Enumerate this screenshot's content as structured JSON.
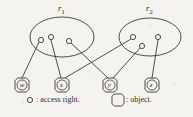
{
  "figure": {
    "type": "access-control-diagram",
    "stroke_color": "#3a3a3a",
    "background_color": "#f4f3f0"
  },
  "roles": [
    {
      "id": "r1",
      "label": "r",
      "subscript": "1",
      "label_x": 58,
      "label_y": 4,
      "ellipse": {
        "cx": 62,
        "cy": 37,
        "rx": 32,
        "ry": 20
      },
      "access_rights": [
        {
          "id": "r1-a1",
          "cx": 41,
          "cy": 40,
          "r": 2.6
        },
        {
          "id": "r1-a2",
          "cx": 51,
          "cy": 37,
          "r": 2.6
        },
        {
          "id": "r1-a3",
          "cx": 69,
          "cy": 41,
          "r": 2.6
        }
      ]
    },
    {
      "id": "r2",
      "label": "r",
      "subscript": "2",
      "label_x": 146,
      "label_y": 4,
      "ellipse": {
        "cx": 150,
        "cy": 37,
        "rx": 31,
        "ry": 19
      },
      "access_rights": [
        {
          "id": "r2-a1",
          "cx": 133,
          "cy": 37,
          "r": 2.6
        },
        {
          "id": "r2-a2",
          "cx": 142,
          "cy": 46,
          "r": 2.6
        },
        {
          "id": "r2-a3",
          "cx": 158,
          "cy": 37,
          "r": 2.6
        }
      ]
    }
  ],
  "objects": [
    {
      "id": "obj-w",
      "label": "w",
      "cx": 22,
      "cy": 85,
      "r": 7
    },
    {
      "id": "obj-x",
      "label": "x",
      "cx": 62,
      "cy": 85,
      "r": 7
    },
    {
      "id": "obj-y",
      "label": "y",
      "cx": 110,
      "cy": 85,
      "r": 7
    },
    {
      "id": "obj-z",
      "label": "z",
      "cx": 152,
      "cy": 85,
      "r": 7
    }
  ],
  "edges": [
    {
      "id": "edge-r1a1-w",
      "from": "r1-a1",
      "to": "obj-w",
      "x1": 39,
      "y1": 42,
      "x2": 22,
      "y2": 78
    },
    {
      "id": "edge-r1a2-x",
      "from": "r1-a2",
      "to": "obj-x",
      "x1": 51,
      "y1": 40,
      "x2": 61,
      "y2": 78
    },
    {
      "id": "edge-r1a3-y",
      "from": "r1-a3",
      "to": "obj-y",
      "x1": 71,
      "y1": 43,
      "x2": 108,
      "y2": 78
    },
    {
      "id": "edge-r2a1-x",
      "from": "r2-a1",
      "to": "obj-x",
      "x1": 131,
      "y1": 39,
      "x2": 65,
      "y2": 78
    },
    {
      "id": "edge-r2a2-y",
      "from": "r2-a2",
      "to": "obj-y",
      "x1": 140,
      "y1": 48,
      "x2": 113,
      "y2": 78
    },
    {
      "id": "edge-r2a3-z",
      "from": "r2-a3",
      "to": "obj-z",
      "x1": 158,
      "y1": 40,
      "x2": 152,
      "y2": 78
    }
  ],
  "legend": {
    "access_right": {
      "symbol_cx": 30,
      "symbol_cy": 100,
      "symbol_r": 2.6,
      "text": ": access right.",
      "text_x": 36,
      "text_y": 96
    },
    "object": {
      "symbol_cx": 118,
      "symbol_cy": 100,
      "symbol_r": 6,
      "text": ": object.",
      "text_x": 126,
      "text_y": 96
    }
  }
}
